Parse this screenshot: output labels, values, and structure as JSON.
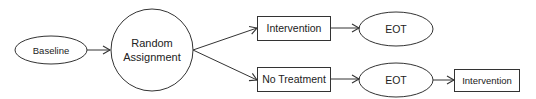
{
  "diagram": {
    "type": "flowchart",
    "nodes": {
      "baseline": {
        "label": "Baseline",
        "shape": "ellipse"
      },
      "random": {
        "line1": "Random",
        "line2": "Assignment",
        "shape": "circle"
      },
      "intervention_top": {
        "label": "Intervention",
        "shape": "rectangle"
      },
      "no_treatment": {
        "label": "No Treatment",
        "shape": "rectangle"
      },
      "eot_top": {
        "label": "EOT",
        "shape": "ellipse"
      },
      "eot_bottom": {
        "label": "EOT",
        "shape": "ellipse"
      },
      "intervention_bottom": {
        "label": "Intervention",
        "shape": "rectangle"
      }
    },
    "edges": [
      {
        "from": "Baseline",
        "to": "Random Assignment"
      },
      {
        "from": "Random Assignment",
        "to": "Intervention"
      },
      {
        "from": "Random Assignment",
        "to": "No Treatment"
      },
      {
        "from": "Intervention",
        "to": "EOT"
      },
      {
        "from": "No Treatment",
        "to": "EOT"
      },
      {
        "from": "EOT",
        "to": "Intervention"
      }
    ],
    "colors": {
      "stroke": "#333333",
      "text": "#222222",
      "background": "#ffffff"
    }
  }
}
